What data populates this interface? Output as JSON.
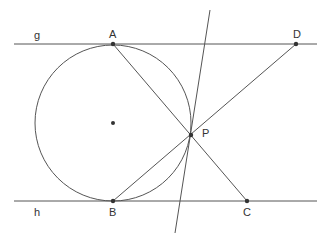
{
  "diagram": {
    "labels": {
      "g": "g",
      "h": "h",
      "A": "A",
      "B": "B",
      "C": "C",
      "D": "D",
      "P": "P"
    },
    "colors": {
      "stroke": "#555555",
      "point": "#333333",
      "text": "#333333"
    },
    "elements": {
      "line_g": {
        "x1": 14,
        "y1": 44,
        "x2": 317,
        "y2": 44
      },
      "line_h": {
        "x1": 14,
        "y1": 201,
        "x2": 317,
        "y2": 201
      },
      "circle": {
        "cx": 113,
        "cy": 123,
        "r": 78
      },
      "points": {
        "A": [
          113,
          44
        ],
        "B": [
          113,
          201
        ],
        "C": [
          247,
          201
        ],
        "D": [
          296,
          44
        ],
        "P": [
          191,
          135
        ],
        "center": [
          113,
          123
        ]
      },
      "segments": [
        {
          "from": "A",
          "to": "C"
        },
        {
          "from": "B",
          "to": "D"
        }
      ],
      "transversal": {
        "x1": 210,
        "y1": 10,
        "x2": 175,
        "y2": 233
      }
    }
  }
}
